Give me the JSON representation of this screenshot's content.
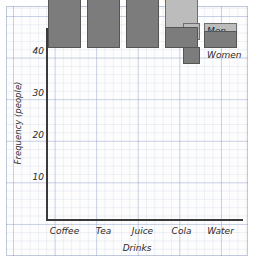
{
  "chart_data": {
    "type": "bar",
    "subtype": "stacked-vertical",
    "title": "Favourite drinks of 100 people",
    "xlabel": "Drinks",
    "ylabel": "Frequency (people)",
    "categories": [
      "Coffee",
      "Tea",
      "Juice",
      "Cola",
      "Water"
    ],
    "series": [
      {
        "name": "Women",
        "color": "#7c7c7c",
        "values": [
          15,
          12,
          14,
          5,
          4
        ]
      },
      {
        "name": "Men",
        "color": "#bcbcbc",
        "values": [
          19,
          10,
          12,
          7,
          2
        ]
      }
    ],
    "totals": [
      34,
      22,
      26,
      12,
      6
    ],
    "ylim": [
      0,
      45
    ],
    "yticks": [
      10,
      20,
      30,
      40
    ],
    "ytick_labels": [
      "10",
      "20",
      "30",
      "40"
    ],
    "grid": true,
    "grid_style": "graph-paper",
    "legend": {
      "position": "top-right",
      "entries": [
        {
          "label": "Men",
          "color": "#bcbcbc"
        },
        {
          "label": "Women",
          "color": "#7c7c7c"
        }
      ]
    }
  }
}
